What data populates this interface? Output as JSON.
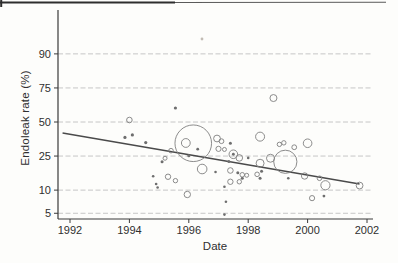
{
  "chart_data": {
    "type": "scatter",
    "subtype": "bubble-meta-regression",
    "xlabel": "Date",
    "ylabel": "Endoleak rate (%)",
    "x_ticks": [
      1992,
      1994,
      1996,
      1998,
      2000,
      2002
    ],
    "y_ticks": [
      5,
      10,
      25,
      50,
      75,
      90
    ],
    "y_scale": "logit",
    "xlim": [
      1991.6,
      2002.15
    ],
    "grid": "horizontal-dashed",
    "colors": {
      "bubble_stroke": "#7f7f7f",
      "dot_fill": "#6e6e6e",
      "trend_line": "#4a4a4a",
      "gridline": "#c6c6c6",
      "axis": "#3a3a3a",
      "text": "#2f2f2f"
    },
    "trend_line": {
      "year_start": 1991.75,
      "rate_start": 41.2,
      "year_end": 2001.75,
      "rate_end": 11.9
    },
    "points": [
      {
        "year": 1994.0,
        "rate": 51.6,
        "r": 2.8
      },
      {
        "year": 1993.85,
        "rate": 37.8,
        "r": 1.6
      },
      {
        "year": 1994.1,
        "rate": 39.7,
        "r": 1.6
      },
      {
        "year": 1994.55,
        "rate": 34.0,
        "r": 1.6
      },
      {
        "year": 1994.8,
        "rate": 14.8,
        "r": 1.3
      },
      {
        "year": 1994.9,
        "rate": 11.9,
        "r": 1.3
      },
      {
        "year": 1994.95,
        "rate": 10.8,
        "r": 1.3
      },
      {
        "year": 1995.1,
        "rate": 21.7,
        "r": 1.5
      },
      {
        "year": 1995.2,
        "rate": 23.7,
        "r": 2.0
      },
      {
        "year": 1995.3,
        "rate": 14.6,
        "r": 2.7
      },
      {
        "year": 1995.4,
        "rate": 28.4,
        "r": 2.3
      },
      {
        "year": 1995.55,
        "rate": 61.1,
        "r": 1.6
      },
      {
        "year": 1995.55,
        "rate": 13.1,
        "r": 2.2
      },
      {
        "year": 1995.9,
        "rate": 33.7,
        "r": 4.4
      },
      {
        "year": 1995.95,
        "rate": 8.8,
        "r": 3.2
      },
      {
        "year": 1996.0,
        "rate": 25.2,
        "r": 1.5
      },
      {
        "year": 1996.15,
        "rate": 33.5,
        "r": 18.3
      },
      {
        "year": 1996.3,
        "rate": 29.4,
        "r": 1.4
      },
      {
        "year": 1996.45,
        "rate": 18.0,
        "r": 4.8
      },
      {
        "year": 1996.9,
        "rate": 16.6,
        "r": 1.3
      },
      {
        "year": 1996.95,
        "rate": 37.0,
        "r": 3.4
      },
      {
        "year": 1997.0,
        "rate": 29.6,
        "r": 2.6
      },
      {
        "year": 1997.1,
        "rate": 35.0,
        "r": 2.4
      },
      {
        "year": 1997.2,
        "rate": 29.2,
        "r": 2.0
      },
      {
        "year": 1997.2,
        "rate": 4.8,
        "r": 1.3
      },
      {
        "year": 1997.2,
        "rate": 11.0,
        "r": 1.3
      },
      {
        "year": 1997.25,
        "rate": 7.1,
        "r": 1.3
      },
      {
        "year": 1997.35,
        "rate": 21.9,
        "r": 1.5
      },
      {
        "year": 1997.4,
        "rate": 33.5,
        "r": 1.5
      },
      {
        "year": 1997.4,
        "rate": 17.3,
        "r": 2.8
      },
      {
        "year": 1997.4,
        "rate": 12.7,
        "r": 2.7
      },
      {
        "year": 1997.5,
        "rate": 26.1,
        "r": 4.3
      },
      {
        "year": 1997.5,
        "rate": 26.1,
        "r": 1.4
      },
      {
        "year": 1997.65,
        "rate": 16.3,
        "r": 1.5
      },
      {
        "year": 1997.7,
        "rate": 23.9,
        "r": 3.3
      },
      {
        "year": 1997.7,
        "rate": 12.7,
        "r": 2.2
      },
      {
        "year": 1997.8,
        "rate": 14.0,
        "r": 1.5
      },
      {
        "year": 1997.8,
        "rate": 15.4,
        "r": 2.3
      },
      {
        "year": 1997.95,
        "rate": 15.2,
        "r": 2.0
      },
      {
        "year": 1998.0,
        "rate": 23.9,
        "r": 1.3
      },
      {
        "year": 1998.3,
        "rate": 15.6,
        "r": 2.3
      },
      {
        "year": 1998.4,
        "rate": 14.0,
        "r": 1.5
      },
      {
        "year": 1998.4,
        "rate": 38.4,
        "r": 4.5
      },
      {
        "year": 1998.4,
        "rate": 20.9,
        "r": 4.0
      },
      {
        "year": 1998.45,
        "rate": 16.9,
        "r": 1.5
      },
      {
        "year": 1998.75,
        "rate": 23.7,
        "r": 4.0
      },
      {
        "year": 1998.85,
        "rate": 68.4,
        "r": 3.5
      },
      {
        "year": 1999.05,
        "rate": 32.7,
        "r": 2.2
      },
      {
        "year": 1999.2,
        "rate": 33.8,
        "r": 2.2
      },
      {
        "year": 1999.25,
        "rate": 21.7,
        "r": 11.6
      },
      {
        "year": 1999.35,
        "rate": 14.0,
        "r": 1.3
      },
      {
        "year": 1999.55,
        "rate": 30.7,
        "r": 2.4
      },
      {
        "year": 1999.9,
        "rate": 14.9,
        "r": 3.2
      },
      {
        "year": 2000.0,
        "rate": 33.5,
        "r": 4.3
      },
      {
        "year": 2000.15,
        "rate": 7.9,
        "r": 2.6
      },
      {
        "year": 2000.4,
        "rate": 14.0,
        "r": 2.3
      },
      {
        "year": 2000.55,
        "rate": 8.4,
        "r": 1.4
      },
      {
        "year": 2000.6,
        "rate": 11.5,
        "r": 4.6
      },
      {
        "year": 2001.75,
        "rate": 11.4,
        "r": 3.4
      }
    ],
    "scan_artifacts": {
      "top_edge_line": true,
      "speck": {
        "x": 202,
        "y": 39
      }
    }
  }
}
